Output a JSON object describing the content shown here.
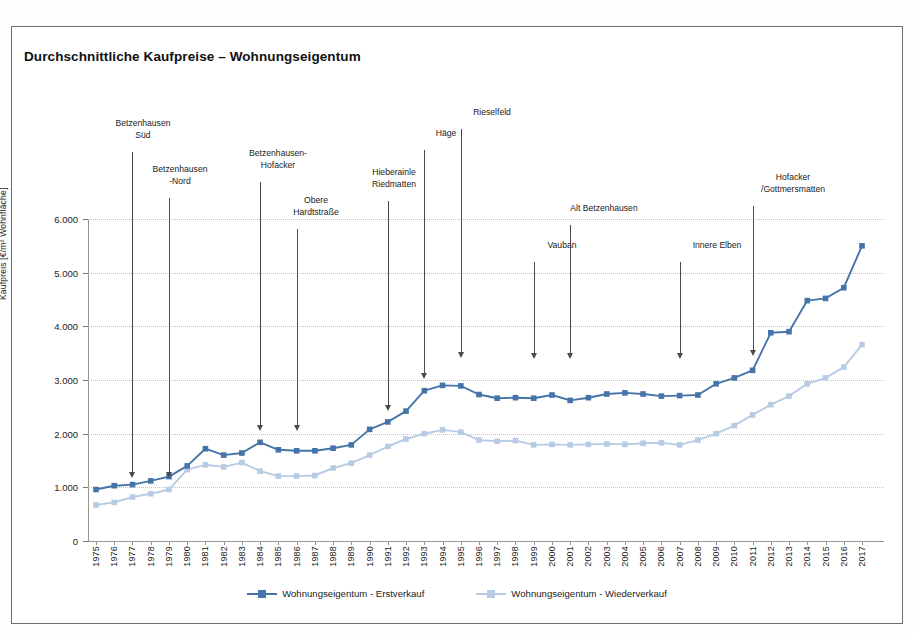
{
  "title": "Durchschnittliche Kaufpreise – Wohnungseigentum",
  "colors": {
    "series1": "#4574a8",
    "series2": "#b7cce4",
    "grid": "#c9c2b6",
    "axis": "#9a948a",
    "arrow": "#4a4a4a",
    "border": "#6e6e6e"
  },
  "axes": {
    "y_title": "Kaufpreis [€/m² Wohnfläche]",
    "y_ticks": [
      "0",
      "1.000",
      "2.000",
      "3.000",
      "4.000",
      "5.000",
      "6.000"
    ]
  },
  "legend": {
    "position": "bottom",
    "items": [
      {
        "label": "Wohnungseigentum - Erstverkauf",
        "color": "#4574a8"
      },
      {
        "label": "Wohnungseigentum - Wiederverkauf",
        "color": "#b7cce4"
      }
    ]
  },
  "annotations": [
    {
      "label": "Betzenhausen\nSüd",
      "year": 1977,
      "label_x": 143,
      "label_y": 118,
      "arrow_top": 152,
      "arrow_bottom": 478
    },
    {
      "label": "Betzenhausen\n-Nord",
      "year": 1979,
      "label_x": 180,
      "label_y": 164,
      "arrow_top": 198,
      "arrow_bottom": 478
    },
    {
      "label": "Betzenhausen-\nHofacker",
      "year": 1984,
      "label_x": 278,
      "label_y": 148,
      "arrow_top": 182,
      "arrow_bottom": 431
    },
    {
      "label": "Obere\nHardtstraße",
      "year": 1986,
      "label_x": 316,
      "label_y": 195,
      "arrow_top": 229,
      "arrow_bottom": 431
    },
    {
      "label": "Hieberainle\nRiedmatten",
      "year": 1991,
      "label_x": 394,
      "label_y": 167,
      "arrow_top": 201,
      "arrow_bottom": 411
    },
    {
      "label": "Häge",
      "year": 1993,
      "label_x": 446,
      "label_y": 128,
      "arrow_top": 150,
      "arrow_bottom": 379
    },
    {
      "label": "Rieselfeld",
      "year": 1995,
      "label_x": 492,
      "label_y": 107,
      "arrow_top": 129,
      "arrow_bottom": 358
    },
    {
      "label": "Vauban",
      "year": 1999,
      "label_x": 562,
      "label_y": 240,
      "arrow_top": 262,
      "arrow_bottom": 359
    },
    {
      "label": "Alt Betzenhausen",
      "year": 2001,
      "label_x": 604,
      "label_y": 203,
      "arrow_top": 225,
      "arrow_bottom": 359
    },
    {
      "label": "Innere Elben",
      "year": 2007,
      "label_x": 717,
      "label_y": 240,
      "arrow_top": 262,
      "arrow_bottom": 359
    },
    {
      "label": "Hofacker\n/Gottmersmatten",
      "year": 2011,
      "label_x": 793,
      "label_y": 172,
      "arrow_top": 206,
      "arrow_bottom": 356
    }
  ],
  "chart_data": {
    "type": "line",
    "title": "Durchschnittliche Kaufpreise – Wohnungseigentum",
    "xlabel": "",
    "ylabel": "Kaufpreis [€/m² Wohnfläche]",
    "ylim": [
      0,
      6000
    ],
    "ytick_step": 1000,
    "grid": true,
    "legend_position": "bottom",
    "categories": [
      "1975",
      "1976",
      "1977",
      "1978",
      "1979",
      "1980",
      "1981",
      "1982",
      "1983",
      "1984",
      "1985",
      "1986",
      "1987",
      "1988",
      "1989",
      "1990",
      "1991",
      "1992",
      "1993",
      "1994",
      "1995",
      "1996",
      "1997",
      "1998",
      "1999",
      "2000",
      "2001",
      "2002",
      "2003",
      "2004",
      "2005",
      "2006",
      "2007",
      "2008",
      "2009",
      "2010",
      "2011",
      "2012",
      "2013",
      "2014",
      "2015",
      "2016",
      "2017"
    ],
    "series": [
      {
        "name": "Wohnungseigentum - Erstverkauf",
        "color": "#4574a8",
        "values": [
          960,
          1030,
          1050,
          1120,
          1200,
          1400,
          1720,
          1600,
          1640,
          1840,
          1700,
          1680,
          1680,
          1730,
          1790,
          2080,
          2220,
          2420,
          2800,
          2900,
          2890,
          2730,
          2660,
          2670,
          2660,
          2720,
          2620,
          2670,
          2740,
          2760,
          2740,
          2700,
          2710,
          2720,
          2930,
          3040,
          3180,
          3880,
          3900,
          4480,
          4520,
          4720,
          5500
        ]
      },
      {
        "name": "Wohnungseigentum - Wiederverkauf",
        "color": "#b7cce4",
        "values": [
          670,
          720,
          820,
          880,
          960,
          1330,
          1420,
          1380,
          1460,
          1300,
          1210,
          1210,
          1220,
          1360,
          1450,
          1600,
          1760,
          1900,
          2000,
          2070,
          2030,
          1880,
          1860,
          1870,
          1790,
          1800,
          1790,
          1800,
          1810,
          1800,
          1820,
          1830,
          1790,
          1880,
          2000,
          2150,
          2350,
          2540,
          2700,
          2930,
          3040,
          3240,
          3660
        ]
      }
    ]
  }
}
